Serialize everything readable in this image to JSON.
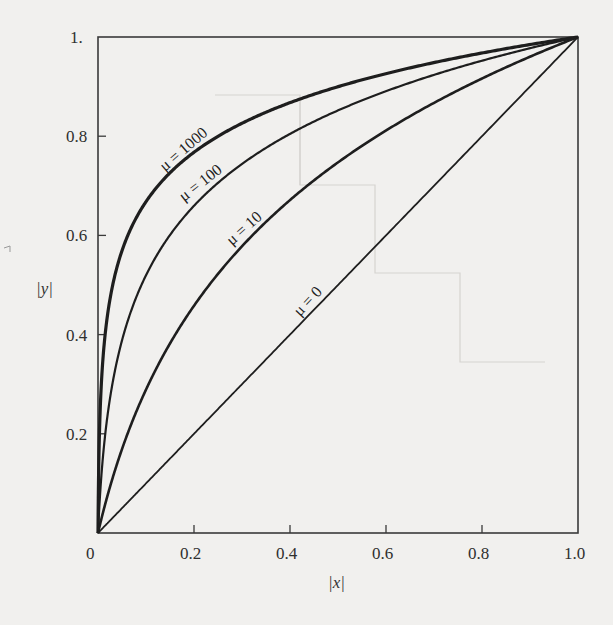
{
  "chart_data": {
    "type": "line",
    "title": "",
    "xlabel": "|x|",
    "ylabel": "|y|",
    "xlim": [
      0,
      1.0
    ],
    "ylim": [
      0,
      1.0
    ],
    "grid": false,
    "legend": "none (inline curve labels)",
    "formula": "|y| = ln(1 + mu*|x|) / ln(1 + mu)",
    "x_ticks": [
      "0",
      "0.2",
      "0.4",
      "0.6",
      "0.8",
      "1.0"
    ],
    "y_ticks": [
      "0.2",
      "0.4",
      "0.6",
      "0.8",
      "1."
    ],
    "x": [
      0,
      0.01,
      0.02,
      0.05,
      0.1,
      0.2,
      0.3,
      0.4,
      0.5,
      0.6,
      0.7,
      0.8,
      0.9,
      1.0
    ],
    "series": [
      {
        "name": "μ = 1000",
        "mu": 1000,
        "stroke_width": 3.2,
        "values": [
          0,
          0.3474,
          0.4408,
          0.5701,
          0.6681,
          0.7667,
          0.8254,
          0.8667,
          0.8997,
          0.9258,
          0.9481,
          0.9676,
          0.9847,
          1.0
        ]
      },
      {
        "name": "μ = 100",
        "mu": 100,
        "stroke_width": 2.2,
        "values": [
          0,
          0.1502,
          0.238,
          0.3889,
          0.5195,
          0.6589,
          0.7445,
          0.804,
          0.852,
          0.891,
          0.9245,
          0.9536,
          0.9781,
          1.0
        ]
      },
      {
        "name": "μ = 10",
        "mu": 10,
        "stroke_width": 2.6,
        "values": [
          0,
          0.0397,
          0.076,
          0.1691,
          0.2891,
          0.4582,
          0.5736,
          0.6548,
          0.7472,
          0.807,
          0.8561,
          0.8977,
          0.9507,
          1.0
        ]
      },
      {
        "name": "μ = 0",
        "mu": 0,
        "stroke_width": 1.8,
        "values": [
          0,
          0.01,
          0.02,
          0.05,
          0.1,
          0.2,
          0.3,
          0.4,
          0.5,
          0.6,
          0.7,
          0.8,
          0.9,
          1.0
        ]
      }
    ],
    "annotations": [
      {
        "text": "μ = 1000",
        "x": 0.15,
        "y": 0.76,
        "rotation": -40
      },
      {
        "text": "μ = 100",
        "x": 0.22,
        "y": 0.71,
        "rotation": -38
      },
      {
        "text": "μ = 10",
        "x": 0.35,
        "y": 0.58,
        "rotation": -40
      },
      {
        "text": "μ = 0",
        "x": 0.5,
        "y": 0.33,
        "rotation": -46
      }
    ]
  },
  "axes": {
    "x_label": "|x|",
    "y_label": "|y|",
    "x_tick_labels": [
      "0",
      "0.2",
      "0.4",
      "0.6",
      "0.8",
      "1.0"
    ],
    "y_tick_labels": [
      "0.2",
      "0.4",
      "0.6",
      "0.8",
      "1."
    ]
  },
  "labels": {
    "mu1000": "μ = 1000",
    "mu100": "μ = 100",
    "mu10": "μ = 10",
    "mu0": "μ = 0"
  },
  "colors": {
    "ink": "#1e1e1e",
    "paper": "#f1f0ee",
    "frame": "#3a3a3a"
  }
}
